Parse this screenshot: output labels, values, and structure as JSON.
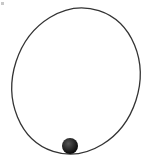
{
  "diagram": {
    "orbit": {
      "cx": 76,
      "cy": 81,
      "rx": 63,
      "ry": 74,
      "rotation_deg": 18,
      "stroke": "#333333",
      "stroke_width": 1.3
    },
    "ball": {
      "cx": 70,
      "cy": 146,
      "r": 8,
      "fill": "#111111",
      "highlight": "#555555"
    }
  }
}
